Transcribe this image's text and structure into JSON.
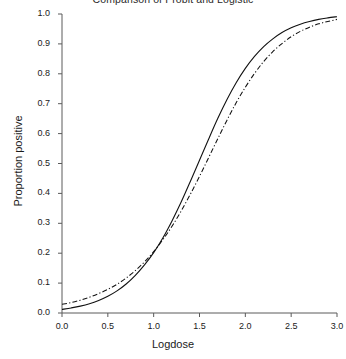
{
  "chart_data": {
    "type": "line",
    "title": "Comparison of Probit and Logistic",
    "xlabel": "Logdose",
    "ylabel": "Proportion positive",
    "xlim": [
      0.0,
      3.0
    ],
    "ylim": [
      0.0,
      1.0
    ],
    "grid": false,
    "legend": "none",
    "xticks": [
      "0.0",
      "0.5",
      "1.0",
      "1.5",
      "2.0",
      "2.5",
      "3.0"
    ],
    "xtick_values": [
      0.0,
      0.5,
      1.0,
      1.5,
      2.0,
      2.5,
      3.0
    ],
    "yticks": [
      "0.0",
      "0.1",
      "0.2",
      "0.3",
      "0.4",
      "0.5",
      "0.6",
      "0.7",
      "0.8",
      "0.9",
      "1.0"
    ],
    "ytick_values": [
      0.0,
      0.1,
      0.2,
      0.3,
      0.4,
      0.5,
      0.6,
      0.7,
      0.8,
      0.9,
      1.0
    ],
    "x": [
      0.0,
      0.1,
      0.2,
      0.3,
      0.4,
      0.5,
      0.6,
      0.7,
      0.8,
      0.9,
      1.0,
      1.1,
      1.2,
      1.3,
      1.4,
      1.5,
      1.6,
      1.7,
      1.8,
      1.9,
      2.0,
      2.1,
      2.2,
      2.3,
      2.4,
      2.5,
      2.6,
      2.7,
      2.8,
      2.9,
      3.0
    ],
    "series": [
      {
        "name": "Probit",
        "style": "solid",
        "color": "#111111",
        "values": [
          0.012,
          0.017,
          0.023,
          0.031,
          0.042,
          0.056,
          0.074,
          0.097,
          0.126,
          0.161,
          0.202,
          0.251,
          0.308,
          0.371,
          0.44,
          0.511,
          0.582,
          0.651,
          0.714,
          0.77,
          0.818,
          0.858,
          0.891,
          0.917,
          0.938,
          0.954,
          0.966,
          0.975,
          0.982,
          0.987,
          0.991
        ]
      },
      {
        "name": "Logistic",
        "style": "dashdot",
        "color": "#111111",
        "values": [
          0.029,
          0.035,
          0.043,
          0.053,
          0.065,
          0.079,
          0.096,
          0.117,
          0.142,
          0.171,
          0.205,
          0.245,
          0.29,
          0.341,
          0.397,
          0.457,
          0.52,
          0.583,
          0.645,
          0.703,
          0.755,
          0.801,
          0.841,
          0.874,
          0.901,
          0.924,
          0.942,
          0.956,
          0.967,
          0.975,
          0.982
        ]
      }
    ]
  }
}
